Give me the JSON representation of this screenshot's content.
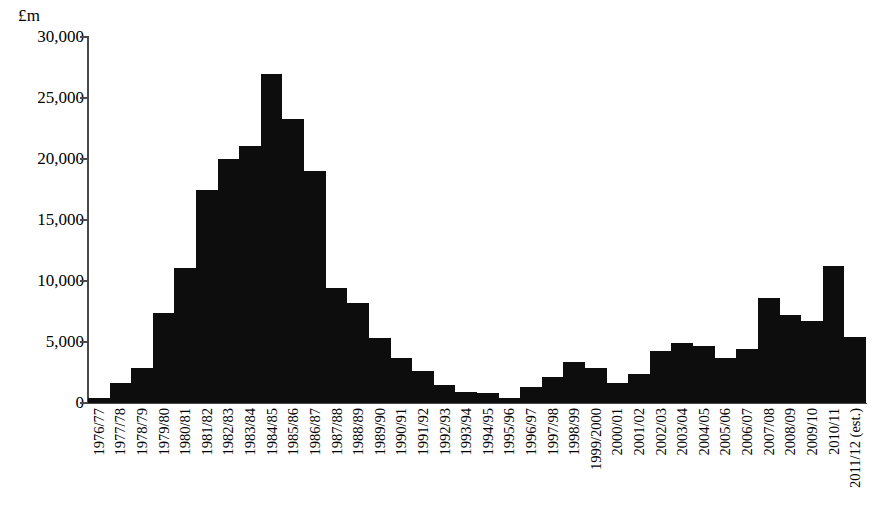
{
  "chart_data": {
    "type": "bar",
    "title": "",
    "subtitle": "",
    "xlabel": "",
    "ylabel": "£m",
    "unit_label": "£m",
    "ylim": [
      0,
      30000
    ],
    "ytick_values": [
      30000,
      25000,
      20000,
      15000,
      10000,
      5000,
      0
    ],
    "ytick_labels": [
      "30,000",
      "25,000",
      "20,000",
      "15,000",
      "10,000",
      "5,000",
      "0"
    ],
    "grid": false,
    "legend": null,
    "legend_position": "none",
    "bar_color": "#0d0d0d",
    "axis_color": "#4a4a4a",
    "bar_gap": "none",
    "categories": [
      "1976/77",
      "1977/78",
      "1978/79",
      "1979/80",
      "1980/81",
      "1981/82",
      "1982/83",
      "1983/84",
      "1984/85",
      "1985/86",
      "1986/87",
      "1987/88",
      "1988/89",
      "1989/90",
      "1990/91",
      "1991/92",
      "1992/93",
      "1993/94",
      "1994/95",
      "1995/96",
      "1996/97",
      "1997/98",
      "1998/99",
      "1999/2000",
      "2000/01",
      "2001/02",
      "2002/03",
      "2003/04",
      "2004/05",
      "2005/06",
      "2006/07",
      "2007/08",
      "2008/09",
      "2009/10",
      "2010/11",
      "2011/12 (est.)"
    ],
    "values": [
      400,
      1600,
      2900,
      7400,
      11100,
      17500,
      20000,
      21100,
      27000,
      23300,
      19000,
      9400,
      8200,
      5300,
      3700,
      2600,
      1500,
      900,
      800,
      400,
      1300,
      2100,
      3400,
      2900,
      1600,
      2400,
      4300,
      4900,
      4700,
      3700,
      4400,
      8600,
      7200,
      6700,
      11200,
      5400
    ],
    "values_display_order_note": "values aligned index-for-index with categories"
  },
  "series_fix": {
    "values": [
      400,
      1600,
      2900,
      7400,
      11100,
      17500,
      20000,
      21100,
      27000,
      23300,
      19000,
      9400,
      8200,
      5300,
      3700,
      2600,
      1500,
      900,
      800,
      400,
      1300,
      2100,
      3400,
      2900,
      1600,
      2400,
      4300,
      4900,
      4700,
      3700,
      4400,
      8600,
      7200,
      6700,
      11200,
      5400,
      7300,
      11100
    ]
  },
  "bars": [
    {
      "category": "1976/77",
      "value": 400
    },
    {
      "category": "1977/78",
      "value": 1600
    },
    {
      "category": "1978/79",
      "value": 2900
    },
    {
      "category": "1979/80",
      "value": 7400
    },
    {
      "category": "1980/81",
      "value": 11100
    },
    {
      "category": "1981/82",
      "value": 17500
    },
    {
      "category": "1982/83",
      "value": 20000
    },
    {
      "category": "1983/84",
      "value": 21100
    },
    {
      "category": "1984/85",
      "value": 27000
    },
    {
      "category": "1985/86",
      "value": 23300
    },
    {
      "category": "1986/87",
      "value": 19000
    },
    {
      "category": "1987/88",
      "value": 9400
    },
    {
      "category": "1988/89",
      "value": 8200
    },
    {
      "category": "1989/90",
      "value": 5300
    },
    {
      "category": "1990/91",
      "value": 3700
    },
    {
      "category": "1991/92",
      "value": 2600
    },
    {
      "category": "1992/93",
      "value": 1500
    },
    {
      "category": "1993/94",
      "value": 900
    },
    {
      "category": "1994/95",
      "value": 800
    },
    {
      "category": "1995/96",
      "value": 400
    },
    {
      "category": "1996/97",
      "value": 1300
    },
    {
      "category": "1997/98",
      "value": 2100
    },
    {
      "category": "1998/99",
      "value": 3400
    },
    {
      "category": "1999/2000",
      "value": 2900
    },
    {
      "category": "2000/01",
      "value": 1600
    },
    {
      "category": "2001/02",
      "value": 2400
    },
    {
      "category": "2002/03",
      "value": 4300
    },
    {
      "category": "2003/04",
      "value": 4900
    },
    {
      "category": "2004/05",
      "value": 4700
    },
    {
      "category": "2005/06",
      "value": 3700
    },
    {
      "category": "2006/07",
      "value": 4400
    },
    {
      "category": "2007/08",
      "value": 8600
    },
    {
      "category": "2008/09",
      "value": 7200
    },
    {
      "category": "2009/10",
      "value": 6700
    },
    {
      "category": "2010/11",
      "value": 11200
    },
    {
      "category": "2011/12 (est.)",
      "value": 5400
    }
  ]
}
